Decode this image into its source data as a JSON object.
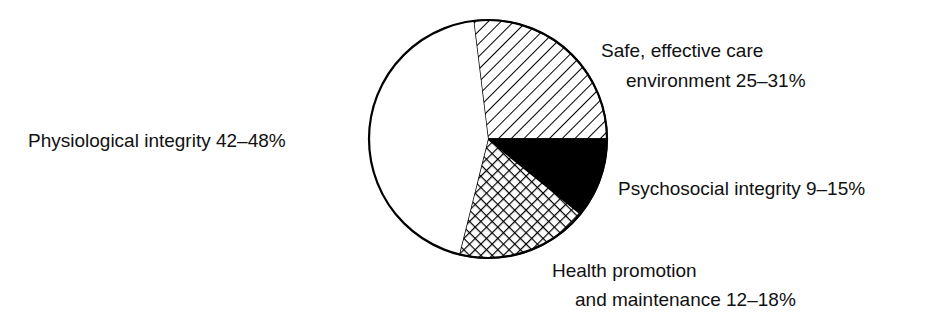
{
  "chart_data": {
    "type": "pie",
    "title": "",
    "slices": [
      {
        "label": "Safe, effective care environment 25–31%",
        "range": "25–31%",
        "min": 25,
        "max": 31,
        "value": 27,
        "fill": "diagonal-hatch",
        "start_deg": -7,
        "end_deg": 90
      },
      {
        "label": "Psychosocial integrity 9–15%",
        "range": "9–15%",
        "min": 9,
        "max": 15,
        "value": 11,
        "fill": "solid-black",
        "start_deg": 90,
        "end_deg": 129
      },
      {
        "label": "Health promotion and maintenance 12–18%",
        "range": "12–18%",
        "min": 12,
        "max": 18,
        "value": 18,
        "fill": "crosshatch",
        "start_deg": 129,
        "end_deg": 194
      },
      {
        "label": "Physiological integrity 42–48%",
        "range": "42–48%",
        "min": 42,
        "max": 48,
        "value": 44,
        "fill": "white",
        "start_deg": 194,
        "end_deg": 353
      }
    ],
    "legend": "none (direct labels)",
    "colors": {
      "stroke": "#000000",
      "background": "#ffffff",
      "text": "#111111"
    }
  },
  "labels": {
    "safe_line1": "Safe, effective care",
    "safe_line2": "environment 25–31%",
    "psychosocial": "Psychosocial integrity 9–15%",
    "health_line1": "Health promotion",
    "health_line2": "and maintenance 12–18%",
    "physiological": "Physiological integrity 42–48%"
  }
}
